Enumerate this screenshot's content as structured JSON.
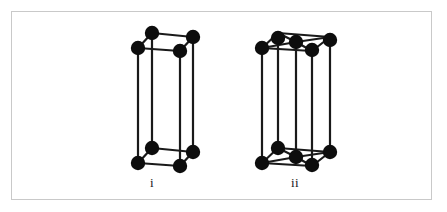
{
  "figure": {
    "background_color": "#ffffff",
    "frame": {
      "border_color": "#c9c9c9",
      "border_width": 1,
      "x": 11,
      "y": 11,
      "width": 421,
      "height": 189
    },
    "style": {
      "edge_color": "#1a1a1a",
      "edge_width": 2.2,
      "atom_color": "#0d0d0d",
      "atom_radius": 7.2
    },
    "cells": [
      {
        "id": "cell-i",
        "label": "i",
        "name": "simple-tetragonal-unit-cell",
        "atom_count": 8,
        "geometry": {
          "front_bottom_left": [
            138,
            163
          ],
          "front_bottom_right": [
            180,
            166
          ],
          "back_bottom_left": [
            152,
            148
          ],
          "back_bottom_right": [
            193,
            152
          ],
          "front_top_left": [
            138,
            48
          ],
          "front_top_right": [
            180,
            51
          ],
          "back_top_left": [
            152,
            33
          ],
          "back_top_right": [
            193,
            37
          ]
        },
        "atoms": [
          [
            152,
            33
          ],
          [
            193,
            37
          ],
          [
            138,
            48
          ],
          [
            180,
            51
          ],
          [
            152,
            148
          ],
          [
            193,
            152
          ],
          [
            138,
            163
          ],
          [
            180,
            166
          ]
        ]
      },
      {
        "id": "cell-ii",
        "label": "ii",
        "name": "end-centered-tetragonal-unit-cell",
        "atom_count": 10,
        "geometry": {
          "front_bottom_left": [
            262,
            163
          ],
          "front_bottom_right": [
            312,
            166
          ],
          "back_bottom_left": [
            278,
            148
          ],
          "back_bottom_right": [
            330,
            152
          ],
          "front_top_left": [
            262,
            48
          ],
          "front_top_right": [
            312,
            51
          ],
          "back_top_left": [
            278,
            33
          ],
          "back_top_right": [
            330,
            37
          ],
          "top_face_center": [
            296,
            42
          ],
          "bottom_face_center": [
            296,
            157
          ]
        },
        "atoms": [
          [
            278,
            38
          ],
          [
            330,
            40
          ],
          [
            262,
            48
          ],
          [
            312,
            50
          ],
          [
            296,
            42
          ],
          [
            278,
            148
          ],
          [
            330,
            152
          ],
          [
            262,
            163
          ],
          [
            312,
            165
          ],
          [
            296,
            157
          ]
        ]
      }
    ]
  }
}
